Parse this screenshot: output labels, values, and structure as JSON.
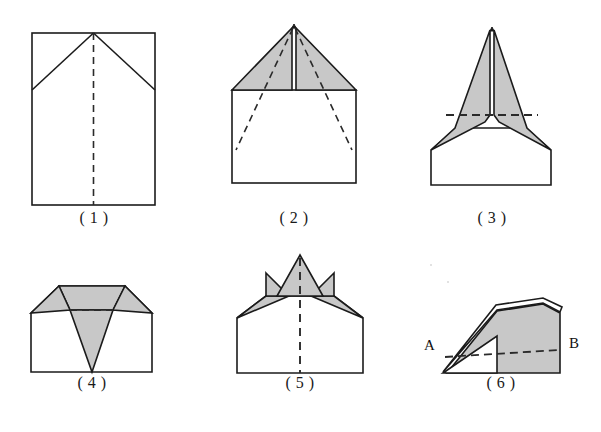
{
  "page": {
    "kind": "figure-sheet",
    "background_color": "#ffffff",
    "width": 601,
    "height": 432
  },
  "style": {
    "line_color": "#1b1b1b",
    "fill_shaded": "#c8c8c8",
    "fill_plain": "#ffffff",
    "dash_color": "#2a2a2a",
    "stroke_width": 1.6,
    "dash_pattern": "7 5"
  },
  "figures": [
    {
      "id": "fig1",
      "caption": "( 1 )",
      "label_number": "1",
      "shaded": false,
      "dash_kind": "vertical-center",
      "note": "upright rectangle with two top corner folds meeting at top-centre apex"
    },
    {
      "id": "fig2",
      "caption": "( 2 )",
      "label_number": "2",
      "shaded": true,
      "dash_kind": "two-diagonals",
      "note": "square body with two shaded triangular flaps forming a peak"
    },
    {
      "id": "fig3",
      "caption": "( 3 )",
      "label_number": "3",
      "shaded": true,
      "dash_kind": "horizontal-center",
      "note": "dart shape: shaded swept wings above a plain trapezoid body"
    },
    {
      "id": "fig4",
      "caption": "( 4 )",
      "label_number": "4",
      "shaded": true,
      "dash_kind": "horizontal-short",
      "note": "wide body, shaded top band with a downward shaded triangle"
    },
    {
      "id": "fig5",
      "caption": "( 5 )",
      "label_number": "5",
      "shaded": true,
      "dash_kind": "vertical-center",
      "note": "trapezoid body with a shaded upward spike and two shaded side wings"
    },
    {
      "id": "fig6",
      "caption": "( 6 )",
      "label_number": "6",
      "shaded": true,
      "dash_kind": "horizontal-center",
      "note": "side view of the finished plane; nose at A, tail at B",
      "point_labels": {
        "left": "A",
        "right": "B"
      }
    }
  ]
}
